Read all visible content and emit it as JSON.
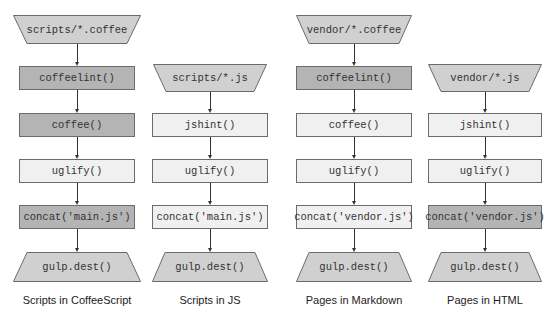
{
  "colors": {
    "dark": "#b4b4b4",
    "medium": "#d0d0d0",
    "light": "#f0f0f0",
    "border": "#6b6b6b",
    "line": "#333333"
  },
  "columns": [
    {
      "caption": "Scripts in CoffeeScript",
      "center_x": 77,
      "nodes": [
        {
          "label": "scripts/*.coffee",
          "shape": "trapezoid-down",
          "fill": "medium",
          "y": 15,
          "h": 29,
          "w": 128
        },
        {
          "label": "coffeelint()",
          "shape": "rect",
          "fill": "dark",
          "y": 66,
          "h": 24,
          "w": 116
        },
        {
          "label": "coffee()",
          "shape": "rect",
          "fill": "dark",
          "y": 113,
          "h": 24,
          "w": 116
        },
        {
          "label": "uglify()",
          "shape": "rect",
          "fill": "light",
          "y": 159,
          "h": 24,
          "w": 116
        },
        {
          "label": "concat('main.js')",
          "shape": "rect",
          "fill": "dark",
          "y": 205,
          "h": 24,
          "w": 116
        },
        {
          "label": "gulp.dest()",
          "shape": "trapezoid-up",
          "fill": "medium",
          "y": 252,
          "h": 30,
          "w": 128
        }
      ]
    },
    {
      "caption": "Scripts in JS",
      "center_x": 210,
      "nodes": [
        {
          "label": "scripts/*.js",
          "shape": "trapezoid-down",
          "fill": "medium",
          "y": 64,
          "h": 28,
          "w": 114
        },
        {
          "label": "jshint()",
          "shape": "rect",
          "fill": "light",
          "y": 113,
          "h": 24,
          "w": 116
        },
        {
          "label": "uglify()",
          "shape": "rect",
          "fill": "light",
          "y": 159,
          "h": 24,
          "w": 116
        },
        {
          "label": "concat('main.js')",
          "shape": "rect",
          "fill": "light",
          "y": 205,
          "h": 24,
          "w": 116
        },
        {
          "label": "gulp.dest()",
          "shape": "trapezoid-up",
          "fill": "medium",
          "y": 252,
          "h": 30,
          "w": 116
        }
      ]
    },
    {
      "caption": "Pages in Markdown",
      "center_x": 354,
      "nodes": [
        {
          "label": "vendor/*.coffee",
          "shape": "trapezoid-down",
          "fill": "medium",
          "y": 15,
          "h": 29,
          "w": 116
        },
        {
          "label": "coffeelint()",
          "shape": "rect",
          "fill": "dark",
          "y": 66,
          "h": 24,
          "w": 116
        },
        {
          "label": "coffee()",
          "shape": "rect",
          "fill": "light",
          "y": 113,
          "h": 24,
          "w": 116
        },
        {
          "label": "uglify()",
          "shape": "rect",
          "fill": "light",
          "y": 159,
          "h": 24,
          "w": 116
        },
        {
          "label": "concat('vendor.js')",
          "shape": "rect",
          "fill": "light",
          "y": 205,
          "h": 24,
          "w": 116
        },
        {
          "label": "gulp.dest()",
          "shape": "trapezoid-up",
          "fill": "medium",
          "y": 252,
          "h": 30,
          "w": 116
        }
      ]
    },
    {
      "caption": "Pages in HTML",
      "center_x": 485,
      "nodes": [
        {
          "label": "vendor/*.js",
          "shape": "trapezoid-down",
          "fill": "medium",
          "y": 64,
          "h": 28,
          "w": 114
        },
        {
          "label": "jshint()",
          "shape": "rect",
          "fill": "light",
          "y": 113,
          "h": 24,
          "w": 114
        },
        {
          "label": "uglify()",
          "shape": "rect",
          "fill": "light",
          "y": 159,
          "h": 24,
          "w": 114
        },
        {
          "label": "concat('vendor.js')",
          "shape": "rect",
          "fill": "dark",
          "y": 205,
          "h": 24,
          "w": 114
        },
        {
          "label": "gulp.dest()",
          "shape": "trapezoid-up",
          "fill": "medium",
          "y": 252,
          "h": 30,
          "w": 114
        }
      ]
    }
  ],
  "caption_y": 294
}
